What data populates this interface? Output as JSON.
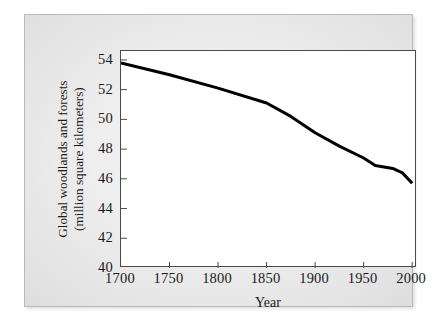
{
  "chart_data": {
    "type": "line",
    "title": "",
    "xlabel": "Year",
    "ylabel": "Global woodlands and forests (million square kilometers)",
    "ylabel_line1": "Global woodlands and forests",
    "ylabel_line2": "(million square kilometers)",
    "xlim": [
      1700,
      2005
    ],
    "ylim": [
      40,
      54.6
    ],
    "xticks": [
      1700,
      1750,
      1800,
      1850,
      1900,
      1950,
      2000
    ],
    "xtick_labels": [
      "1700",
      "1750",
      "1800",
      "1850",
      "1900",
      "1950",
      "2000"
    ],
    "yticks": [
      40,
      42,
      44,
      46,
      48,
      50,
      52,
      54
    ],
    "ytick_labels": [
      "40",
      "42",
      "44",
      "46",
      "48",
      "50",
      "52",
      "54"
    ],
    "grid": false,
    "legend": null,
    "series": [
      {
        "name": "Global woodlands and forests",
        "color": "#000000",
        "line_width": 3,
        "x": [
          1700,
          1750,
          1800,
          1850,
          1875,
          1900,
          1925,
          1950,
          1962,
          1980,
          1990,
          2000
        ],
        "values": [
          53.8,
          53.0,
          52.1,
          51.1,
          50.2,
          49.1,
          48.2,
          47.4,
          46.9,
          46.7,
          46.4,
          45.7
        ],
        "points": [
          {
            "x": 1700,
            "y": 53.8
          },
          {
            "x": 1750,
            "y": 53.0
          },
          {
            "x": 1800,
            "y": 52.1
          },
          {
            "x": 1850,
            "y": 51.1
          },
          {
            "x": 1875,
            "y": 50.2
          },
          {
            "x": 1900,
            "y": 49.1
          },
          {
            "x": 1925,
            "y": 48.2
          },
          {
            "x": 1950,
            "y": 47.4
          },
          {
            "x": 1962,
            "y": 46.9
          },
          {
            "x": 1980,
            "y": 46.7
          },
          {
            "x": 1990,
            "y": 46.4
          },
          {
            "x": 2000,
            "y": 45.7
          }
        ]
      }
    ]
  },
  "colors": {
    "line": "#000000",
    "axis": "#4a4a4a",
    "text": "#1a1a1a",
    "plot_background": "#ffffff",
    "panel_background": "#ededed",
    "panel_border": "#b9b9b9"
  }
}
